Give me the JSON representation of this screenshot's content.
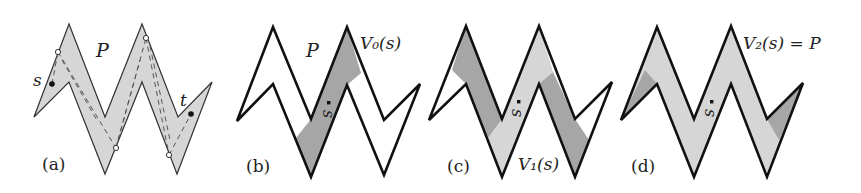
{
  "figure": {
    "panels": [
      {
        "id": "a",
        "caption": "(a)",
        "polygon_label": "P",
        "point_s": "s",
        "point_t": "t"
      },
      {
        "id": "b",
        "caption": "(b)",
        "polygon_label": "P",
        "point_s": "s",
        "region_label": "V₀(s)"
      },
      {
        "id": "c",
        "caption": "(c)",
        "point_s": "s",
        "region_label": "V₁(s)"
      },
      {
        "id": "d",
        "caption": "(d)",
        "point_s": "s",
        "region_label": "V₂(s) = P"
      }
    ],
    "colors": {
      "outline": "#1a1a1a",
      "fill_light": "#d6d6d6",
      "fill_dark": "#a6a6a6",
      "background": "#ffffff"
    }
  }
}
